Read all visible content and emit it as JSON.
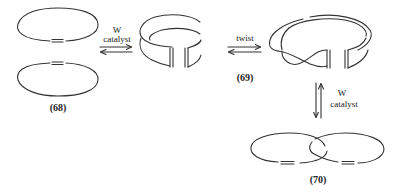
{
  "diagram": {
    "compounds": [
      {
        "id": "68",
        "label": "(68)",
        "description": "two separate cycloalkene rings"
      },
      {
        "id": "69",
        "label": "(69)",
        "description": "cyclic band (cylinder), twisted band"
      },
      {
        "id": "70",
        "label": "(70)",
        "description": "catenane of two interlocked rings"
      }
    ],
    "arrows": [
      {
        "id": "step1",
        "top_label": "W",
        "bottom_label": "catalyst",
        "direction": "equilibrium-horizontal"
      },
      {
        "id": "step2",
        "top_label": "twist",
        "direction": "equilibrium-horizontal"
      },
      {
        "id": "step3",
        "top_label": "W",
        "bottom_label": "catalyst",
        "direction": "equilibrium-vertical"
      }
    ],
    "stroke_color": "#333333",
    "background": "#ffffff"
  }
}
